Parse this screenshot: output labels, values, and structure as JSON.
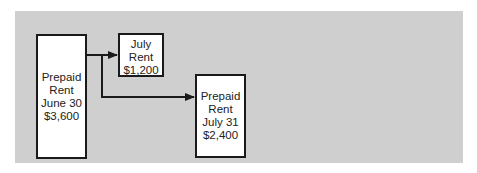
{
  "diagram": {
    "colors": {
      "background": "#ffffff",
      "panel": "#cfcfcf",
      "box_fill": "#ffffff",
      "box_border": "#1a1a1a",
      "arrow": "#1a1a1a",
      "text": "#222222"
    },
    "nodes": [
      {
        "id": "prepaid-rent-june-30",
        "lines": [
          "Prepaid",
          "Rent",
          "June 30",
          "$3,600"
        ]
      },
      {
        "id": "july-rent",
        "lines": [
          "July",
          "Rent",
          "$1,200"
        ]
      },
      {
        "id": "prepaid-rent-july-31",
        "lines": [
          "Prepaid",
          "Rent",
          "July 31",
          "$2,400"
        ]
      }
    ],
    "edges": [
      {
        "from": "prepaid-rent-june-30",
        "to": "july-rent"
      },
      {
        "from": "prepaid-rent-june-30",
        "to": "prepaid-rent-july-31"
      }
    ]
  }
}
